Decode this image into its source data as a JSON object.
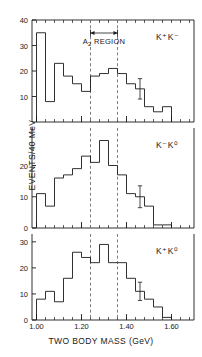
{
  "figure": {
    "xlabel": "TWO BODY MASS (GeV)",
    "ylabel": "EVENTS/40 MeV",
    "annotation": "A",
    "annotation_sub": "2",
    "annotation_rest": " REGION"
  },
  "chart_data": {
    "type": "bar",
    "title": "",
    "xlabel": "TWO BODY MASS (GeV)",
    "ylabel": "EVENTS/40 MeV",
    "xlim": [
      0.98,
      1.7
    ],
    "bin_width": 0.04,
    "grid": false,
    "legend": "none",
    "annotations": [
      {
        "text": "A2 REGION",
        "x_start": 1.24,
        "x_end": 1.36,
        "panel": 0
      }
    ],
    "region_markers": {
      "dashed_x": [
        1.24,
        1.36
      ],
      "label": "A2 REGION"
    },
    "panels": [
      {
        "label": "K⁺K⁻",
        "ylim": [
          0,
          40
        ],
        "yticks": [
          10,
          20,
          30,
          40
        ],
        "bin_edges": [
          1.0,
          1.04,
          1.08,
          1.12,
          1.16,
          1.2,
          1.24,
          1.28,
          1.32,
          1.36,
          1.4,
          1.44,
          1.48,
          1.52,
          1.56,
          1.6
        ],
        "values": [
          35,
          8,
          23,
          18,
          15,
          12,
          18,
          19,
          21,
          19,
          15,
          13,
          6,
          4,
          6
        ],
        "errorbars": [
          {
            "bin_center": 1.46,
            "value": 13,
            "err_low": 4,
            "err_high": 4
          }
        ]
      },
      {
        "label": "K⁻K⁰",
        "ylim": [
          0,
          32
        ],
        "yticks": [
          10,
          20
        ],
        "bin_edges": [
          1.0,
          1.04,
          1.08,
          1.12,
          1.16,
          1.2,
          1.24,
          1.28,
          1.32,
          1.36,
          1.4,
          1.44,
          1.48,
          1.52,
          1.56,
          1.6
        ],
        "values": [
          11,
          7,
          16,
          17,
          19,
          23,
          21,
          28,
          20,
          17,
          11,
          10,
          7,
          1,
          1
        ],
        "errorbars": [
          {
            "bin_center": 1.46,
            "value": 10,
            "err_low": 3.5,
            "err_high": 3.5
          }
        ]
      },
      {
        "label": "K⁺K⁰",
        "ylim": [
          0,
          33
        ],
        "yticks": [
          10,
          20,
          30
        ],
        "bin_edges": [
          1.0,
          1.04,
          1.08,
          1.12,
          1.16,
          1.2,
          1.24,
          1.28,
          1.32,
          1.36,
          1.4,
          1.44,
          1.48,
          1.52,
          1.56,
          1.6
        ],
        "values": [
          8,
          11,
          7,
          16,
          26,
          24,
          22,
          29,
          22,
          22,
          16,
          11,
          8,
          5,
          1
        ],
        "errorbars": [
          {
            "bin_center": 1.46,
            "value": 11,
            "err_low": 3.5,
            "err_high": 3.5
          }
        ]
      }
    ],
    "xticks": [
      {
        "value": 1.0,
        "label": "1.00"
      },
      {
        "value": 1.2,
        "label": "1.20"
      },
      {
        "value": 1.4,
        "label": "1.40"
      },
      {
        "value": 1.6,
        "label": "1.60"
      }
    ]
  }
}
